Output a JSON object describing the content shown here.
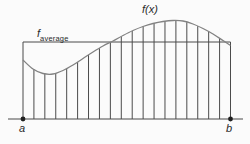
{
  "diagram": {
    "labels": {
      "function": "f(x)",
      "average_base": "f",
      "average_sub": "average",
      "point_a": "a",
      "point_b": "b"
    },
    "colors": {
      "line": "#4b4b4b",
      "curve": "#828282",
      "dot": "#1f1f1f",
      "text": "#2a2a2a",
      "background": "#fbfbfb"
    },
    "geometry": {
      "width": 250,
      "height": 144,
      "axis_y": 119,
      "axis_x_start": 8,
      "axis_x_end": 243,
      "a_x": 23,
      "b_x": 230.5,
      "average_y": 42,
      "partition_count": 20,
      "dot_radius": 2.4,
      "curve_points": [
        [
          23,
          60
        ],
        [
          33,
          69
        ],
        [
          43,
          73.5
        ],
        [
          53,
          74
        ],
        [
          63,
          70.5
        ],
        [
          73,
          65
        ],
        [
          83,
          58.5
        ],
        [
          93,
          52
        ],
        [
          103,
          46
        ],
        [
          113,
          41
        ],
        [
          123,
          35.5
        ],
        [
          133,
          30.5
        ],
        [
          143,
          26.5
        ],
        [
          153,
          23.5
        ],
        [
          163,
          21.5
        ],
        [
          173,
          20.5
        ],
        [
          183,
          21
        ],
        [
          193,
          24
        ],
        [
          203,
          28.5
        ],
        [
          213,
          34
        ],
        [
          223,
          40.5
        ],
        [
          230.5,
          45.5
        ]
      ]
    }
  }
}
